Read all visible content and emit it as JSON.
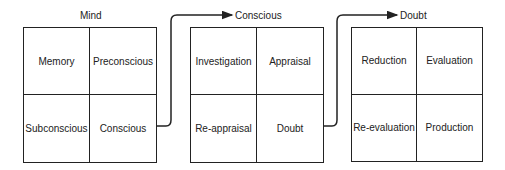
{
  "diagram": {
    "boxes": [
      {
        "title": "Mind",
        "cells": [
          "Memory",
          "Preconscious",
          "Subconscious",
          "Conscious"
        ]
      },
      {
        "title": "Conscious",
        "cells": [
          "Investigation",
          "Appraisal",
          "Re-appraisal",
          "Doubt"
        ]
      },
      {
        "title": "Doubt",
        "cells": [
          "Reduction",
          "Evaluation",
          "Re-evaluation",
          "Production"
        ]
      }
    ],
    "connectors": [
      {
        "from": "Conscious",
        "to": "Conscious"
      },
      {
        "from": "Doubt",
        "to": "Doubt"
      }
    ],
    "colors": {
      "line": "#222222",
      "background": "#ffffff"
    }
  }
}
